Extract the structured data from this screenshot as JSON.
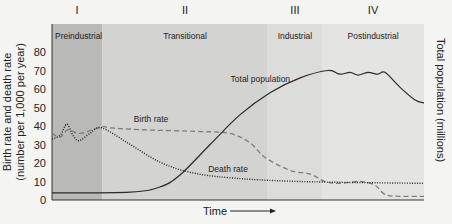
{
  "chart_data": {
    "type": "line",
    "title": "",
    "xlabel": "Time",
    "ylabel": "Birth rate and death rate",
    "ylabel_sub": "(number per 1,000 per year)",
    "y2label": "Total population (millions)",
    "ylim": [
      0,
      80
    ],
    "xlim": [
      0,
      100
    ],
    "yticks": [
      "0",
      "10",
      "20",
      "30",
      "40",
      "50",
      "60",
      "70",
      "80"
    ],
    "grid": false,
    "stages": [
      {
        "numeral": "I",
        "name": "Preindustrial",
        "start": 0,
        "end": 13.5,
        "color": "#b9b9b7"
      },
      {
        "numeral": "II",
        "name": "Transitional",
        "start": 13.5,
        "end": 58,
        "color": "#d3d3d1"
      },
      {
        "numeral": "III",
        "name": "Industrial",
        "start": 58,
        "end": 72.6,
        "color": "#dcdcda"
      },
      {
        "numeral": "IV",
        "name": "Postindustrial",
        "start": 72.6,
        "end": 100,
        "color": "#e4e4e2"
      }
    ],
    "series": [
      {
        "name": "Birth rate",
        "style": "dashed",
        "axis": "left",
        "x": [
          0,
          2.2,
          4.3,
          7.5,
          13.4,
          15.6,
          23.7,
          39.8,
          47.8,
          53.2,
          57.3,
          64.0,
          69.4,
          73.4,
          77.4,
          82.8,
          86.8,
          89.5,
          93.5,
          100
        ],
        "y": [
          36,
          34,
          38,
          36,
          39.5,
          39,
          38,
          37,
          36,
          31,
          23,
          16,
          14,
          10,
          9,
          10,
          8,
          3,
          2,
          2
        ]
      },
      {
        "name": "Death rate",
        "style": "dotted",
        "axis": "left",
        "x": [
          0,
          2.2,
          4.0,
          5.6,
          7.3,
          10.2,
          13.4,
          21.0,
          29.0,
          37.1,
          47.8,
          66.7,
          100
        ],
        "y": [
          33,
          35,
          41,
          35,
          32,
          36,
          39,
          30,
          20.5,
          15,
          12,
          10,
          9
        ]
      },
      {
        "name": "Total population",
        "style": "solid",
        "axis": "right",
        "x": [
          0,
          21.0,
          29.0,
          34.4,
          42.5,
          50.5,
          58.6,
          66.7,
          74.2,
          77.4,
          80.1,
          82.3,
          84.9,
          87.6,
          89.5,
          93.5,
          97.6,
          100
        ],
        "y": [
          3.8,
          4.3,
          7,
          13.5,
          30,
          46,
          58,
          66,
          70,
          68,
          69,
          67.5,
          69,
          68,
          69,
          61,
          54,
          52.5
        ]
      }
    ],
    "annotations": [
      {
        "text": "Total population",
        "x": 48,
        "y": 64
      },
      {
        "text": "Birth rate",
        "x": 22,
        "y": 42
      },
      {
        "text": "Death rate",
        "x": 42,
        "y": 15
      }
    ],
    "legend": "none"
  }
}
